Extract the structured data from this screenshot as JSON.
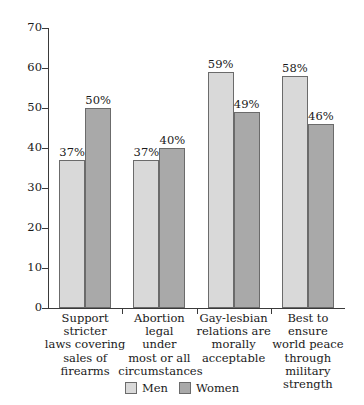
{
  "chart_data": {
    "type": "bar",
    "title": "",
    "subtitle": "",
    "xlabel": "",
    "ylabel": "",
    "ylim": [
      0,
      70
    ],
    "ytick_values": [
      0,
      10,
      20,
      30,
      40,
      50,
      60,
      70
    ],
    "ytick_labels": [
      "0",
      "10",
      "20",
      "30",
      "40",
      "50",
      "60",
      "70"
    ],
    "grid": false,
    "legend_position": "bottom-center",
    "categories": [
      "Support stricter laws covering sales of firearms",
      "Abortion legal under most or all circumstances",
      "Gay-lesbian relations are morally acceptable",
      "Best to ensure world peace through military strength"
    ],
    "category_lines": [
      [
        "Support stricter",
        "laws covering",
        "sales of",
        "firearms"
      ],
      [
        "Abortion",
        "legal",
        "under",
        "most or all",
        "circumstances"
      ],
      [
        "Gay-lesbian",
        "relations are",
        "morally",
        "acceptable"
      ],
      [
        "Best to ensure",
        "world peace",
        "through",
        "military",
        "strength"
      ]
    ],
    "series": [
      {
        "name": "Men",
        "color": "#d9d9d9",
        "values": [
          37,
          37,
          59,
          58
        ],
        "data_labels": [
          "37%",
          "37%",
          "59%",
          "58%"
        ]
      },
      {
        "name": "Women",
        "color": "#a9a9a9",
        "values": [
          50,
          40,
          49,
          46
        ],
        "data_labels": [
          "50%",
          "40%",
          "49%",
          "46%"
        ]
      }
    ]
  },
  "legend": {
    "items": [
      {
        "label": "Men",
        "color": "#d9d9d9"
      },
      {
        "label": "Women",
        "color": "#a9a9a9"
      }
    ]
  },
  "colors": {
    "men": "#d9d9d9",
    "women": "#a9a9a9",
    "bar_outline": "#6b6b6b",
    "axis": "#3a3a3a",
    "text": "#1a1a1a",
    "background": "#ffffff"
  }
}
